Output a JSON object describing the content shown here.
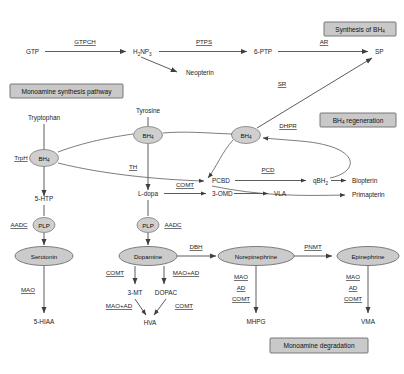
{
  "diagram": {
    "sections": [
      {
        "id": "synthesis_bh4",
        "label": "Synthesis of BH",
        "label_sub": "4"
      },
      {
        "id": "monoamine_synthesis",
        "label": "Monoamine synthesis pathway",
        "label_sub": ""
      },
      {
        "id": "bh4_regeneration",
        "label": "BH",
        "label_sub": "4",
        "label_tail": " regeneration"
      },
      {
        "id": "monoamine_degradation",
        "label": "Monoamine degradation",
        "label_sub": ""
      }
    ],
    "metabolites": {
      "gtp": "GTP",
      "h2np3": "H",
      "h2np3_sub1": "2",
      "h2np3_mid": "NP",
      "h2np3_sub2": "3",
      "ptp6": "6-PTP",
      "sp": "SP",
      "neopterin": "Neopterin",
      "tryptophan": "Tryptophan",
      "tyrosine": "Tyrosine",
      "trph": "TrpH",
      "bh4": "BH",
      "bh4_sub": "4",
      "pcbd": "PCBD",
      "qbh2": "qBH",
      "qbh2_sub": "2",
      "biopterin": "Biopterin",
      "primapterin": "Primapterin",
      "htp5": "5-HTP",
      "ldopa": "L-dopa",
      "omd3": "3-OMD",
      "vla": "VLA",
      "plp": "PLP",
      "serotonin": "Serotonin",
      "dopamine": "Dopamine",
      "norepinephrine": "Norepinephrine",
      "epinephrine": "Epinephrine",
      "mt3": "3-MT",
      "dopac": "DOPAC",
      "hva": "HVA",
      "hiaa5": "5-HIAA",
      "mhpg": "MHPG",
      "vma": "VMA"
    },
    "enzymes": {
      "gtpch": "GTPCH",
      "ptps": "PTPS",
      "ar": "AR",
      "sr": "SR",
      "dhpr": "DHPR",
      "pcd": "PCD",
      "th": "TH",
      "comt": "COMT",
      "aadc": "AADC",
      "dbh": "DBH",
      "pnmt": "PNMT",
      "mao": "MAO",
      "mao_ad": "MAO+AD",
      "ad": "AD"
    },
    "colors": {
      "ellipse_fill": "#cfcfcf",
      "ellipse_stroke": "#7a7a7a",
      "section_box_fill": "#c9c9c9",
      "section_box_stroke": "#6b6b6b",
      "line": "#4a4a4a",
      "text": "#1c1c1c",
      "background": "#ffffff"
    }
  }
}
